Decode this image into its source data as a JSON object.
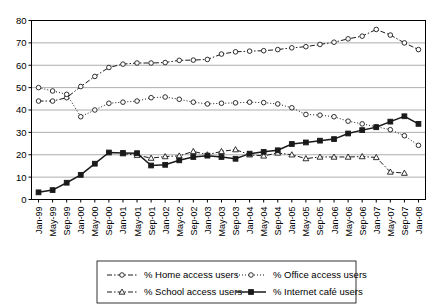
{
  "chart_data": {
    "type": "line",
    "title": "",
    "subtitle": "",
    "xlabel": "",
    "ylabel": "",
    "ylim": [
      0,
      80
    ],
    "ytick_step": 10,
    "grid": true,
    "legend_position": "bottom",
    "yticks": [
      "0",
      "10",
      "20",
      "30",
      "40",
      "50",
      "60",
      "70",
      "80"
    ],
    "categories": [
      "Jan-99",
      "May-99",
      "Sep-99",
      "Jan-00",
      "May-00",
      "Sep-00",
      "Jan-01",
      "May-01",
      "Sep-01",
      "Jan-02",
      "May-02",
      "Sep-02",
      "Jan-03",
      "May-03",
      "Sep-03",
      "Jan-04",
      "May-04",
      "Sep-04",
      "Jan-05",
      "May-05",
      "Sep-05",
      "Jan-06",
      "May-06",
      "Sep-06",
      "Jan-07",
      "May-07",
      "Sep-07",
      "Jan-08"
    ],
    "series": [
      {
        "name": "% Home access users",
        "marker": "open-circle",
        "line_style": "dash-dot",
        "color": "#1a1a1a",
        "values": [
          44.0,
          44.0,
          45.5,
          50.5,
          55.0,
          59.0,
          60.5,
          61.0,
          61.0,
          61.2,
          62.2,
          62.3,
          62.6,
          65.0,
          66.0,
          66.3,
          66.5,
          67.0,
          67.8,
          68.3,
          69.3,
          70.3,
          71.8,
          73.0,
          76.0,
          73.5,
          70.0,
          67.0
        ]
      },
      {
        "name": "% Office access users",
        "marker": "open-circle",
        "line_style": "dotted",
        "color": "#1a1a1a",
        "values": [
          50.0,
          48.5,
          47.0,
          37.0,
          40.0,
          43.0,
          43.5,
          44.0,
          45.5,
          45.8,
          44.8,
          43.5,
          42.7,
          43.0,
          43.2,
          43.5,
          43.3,
          42.7,
          41.0,
          38.0,
          37.7,
          37.0,
          35.0,
          33.8,
          32.5,
          31.2,
          28.5,
          24.2
        ]
      },
      {
        "name": "% School access users",
        "marker": "open-triangle",
        "line_style": "dash-dot",
        "color": "#1a1a1a",
        "values": [
          null,
          null,
          null,
          null,
          null,
          null,
          20.5,
          19.8,
          18.5,
          19.2,
          19.5,
          21.5,
          20.0,
          21.5,
          22.3,
          20.0,
          19.5,
          20.8,
          20.0,
          18.3,
          19.0,
          19.0,
          19.0,
          19.2,
          18.8,
          12.3,
          11.8,
          null
        ]
      },
      {
        "name": "% Internet café users",
        "marker": "solid-square",
        "line_style": "solid",
        "color": "#1a1a1a",
        "values": [
          3.2,
          4.2,
          7.5,
          11.0,
          16.0,
          21.0,
          20.8,
          20.7,
          15.2,
          15.5,
          17.5,
          19.0,
          19.6,
          19.0,
          18.2,
          20.5,
          21.3,
          22.0,
          24.8,
          25.5,
          26.3,
          27.0,
          29.5,
          31.0,
          32.3,
          34.8,
          37.2,
          33.8
        ]
      }
    ]
  },
  "legend": {
    "entries": [
      {
        "label": "% Home access users"
      },
      {
        "label": "% Office access users"
      },
      {
        "label": "% School access users"
      },
      {
        "label": "% Internet café users"
      }
    ]
  }
}
